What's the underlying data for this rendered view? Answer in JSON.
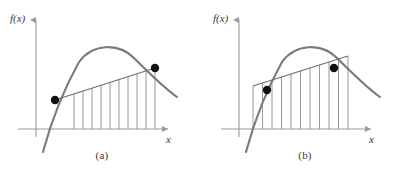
{
  "figure": {
    "background_color": "#ffffff",
    "curve_color": "#7a7a7a",
    "axis_color": "#9a9a9a",
    "secant_color": "#6e6e6e",
    "hatch_color": "#8c8c8c",
    "dot_color": "#111111",
    "text_color": "#3a3a3a"
  },
  "panels": [
    {
      "id": "a",
      "caption": "(a)",
      "y_axis_label": "f(x)",
      "x_axis_label": "x",
      "origin": {
        "x": 36,
        "y": 129
      },
      "axes": {
        "y_axis_top": 18,
        "y_axis_bottom": 137,
        "x_axis_left": 18,
        "x_axis_right": 170
      },
      "curve": {
        "type": "concave-down",
        "points": [
          [
            43,
            150
          ],
          [
            46,
            136
          ],
          [
            49,
            124
          ],
          [
            53,
            110
          ],
          [
            58,
            96
          ],
          [
            64,
            82
          ],
          [
            71,
            70
          ],
          [
            79,
            60
          ],
          [
            88,
            52
          ],
          [
            98,
            47
          ],
          [
            108,
            46
          ],
          [
            118,
            49
          ],
          [
            128,
            55
          ],
          [
            138,
            62
          ],
          [
            148,
            70
          ],
          [
            158,
            79
          ],
          [
            168,
            88
          ],
          [
            176,
            96
          ]
        ]
      },
      "secant": {
        "label": "secant-line",
        "x1": 55,
        "y1": 100,
        "x2": 155,
        "y2": 68,
        "extends_beyond_points": false
      },
      "points": [
        {
          "name": "left-point",
          "x": 55,
          "y": 100
        },
        {
          "name": "right-point",
          "x": 155,
          "y": 68
        }
      ],
      "hatch": {
        "count": 10,
        "from_x": 65,
        "to_x": 155,
        "baseline_y": 129,
        "includes_end_verticals": false
      }
    },
    {
      "id": "b",
      "caption": "(b)",
      "y_axis_label": "f(x)",
      "x_axis_label": "x",
      "origin": {
        "x": 36,
        "y": 129
      },
      "axes": {
        "y_axis_top": 18,
        "y_axis_bottom": 137,
        "x_axis_left": 18,
        "x_axis_right": 170
      },
      "curve": {
        "type": "concave-down",
        "points": [
          [
            43,
            150
          ],
          [
            46,
            136
          ],
          [
            49,
            124
          ],
          [
            53,
            110
          ],
          [
            58,
            96
          ],
          [
            64,
            82
          ],
          [
            71,
            70
          ],
          [
            79,
            60
          ],
          [
            88,
            52
          ],
          [
            98,
            47
          ],
          [
            108,
            46
          ],
          [
            118,
            49
          ],
          [
            128,
            55
          ],
          [
            138,
            62
          ],
          [
            148,
            70
          ],
          [
            158,
            79
          ],
          [
            168,
            88
          ],
          [
            176,
            96
          ]
        ]
      },
      "secant": {
        "label": "extended-secant-line",
        "x1": 50,
        "y1": 102,
        "x2": 145,
        "y2": 72,
        "extends_beyond_points": true,
        "extended_x1": 50,
        "extended_y1": 86,
        "extended_x2": 145,
        "extended_y2": 56
      },
      "points": [
        {
          "name": "left-point",
          "x": 64,
          "y": 90
        },
        {
          "name": "right-point",
          "x": 131,
          "y": 68
        }
      ],
      "hatch": {
        "count": 10,
        "from_x": 50,
        "to_x": 145,
        "baseline_y": 129,
        "includes_end_verticals": true
      }
    }
  ]
}
